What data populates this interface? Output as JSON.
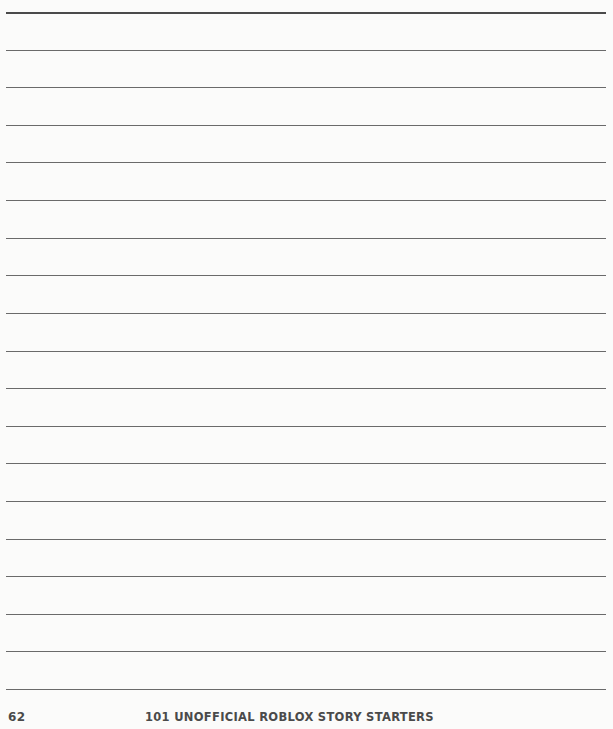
{
  "page": {
    "writing_lines_count": 19,
    "line_color": "#6a6a6a"
  },
  "footer": {
    "page_number": "62",
    "title_part1": "101 ",
    "title_part2": "UNOFFICIAL",
    "title_part3": " ROBLOX STORY STARTERS"
  }
}
